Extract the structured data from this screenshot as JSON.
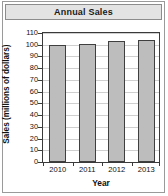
{
  "chart_data": {
    "type": "bar",
    "title": "Annual Sales",
    "xlabel": "Year",
    "ylabel": "Sales (millions of dollars)",
    "categories": [
      "2010",
      "2011",
      "2012",
      "2013"
    ],
    "values": [
      100,
      101,
      103,
      104
    ],
    "ylim": [
      0,
      110
    ],
    "ytick_step": 10,
    "yticks": [
      0,
      10,
      20,
      30,
      40,
      50,
      60,
      70,
      80,
      90,
      100,
      110
    ],
    "ytick_labels": [
      "0",
      "10",
      "20",
      "30",
      "40",
      "50",
      "60",
      "70",
      "80",
      "90",
      "100",
      "110"
    ],
    "grid": true,
    "grid_axis": "y",
    "legend": null,
    "legend_position": "none",
    "series": [
      {
        "name": "Annual Sales",
        "values": [
          100,
          101,
          103,
          104
        ]
      }
    ],
    "colors": {
      "bar_fill": "#bdbdbd",
      "bar_edge": "#3f3f3f",
      "gridline": "#cfcfcf",
      "axis": "#3a3a3a",
      "title_band_fill": "#e3e3e3",
      "title_band_edge": "#8c8c8c",
      "frame_edge": "#9a9a9a",
      "background": "#ffffff",
      "text": "#111111"
    }
  }
}
